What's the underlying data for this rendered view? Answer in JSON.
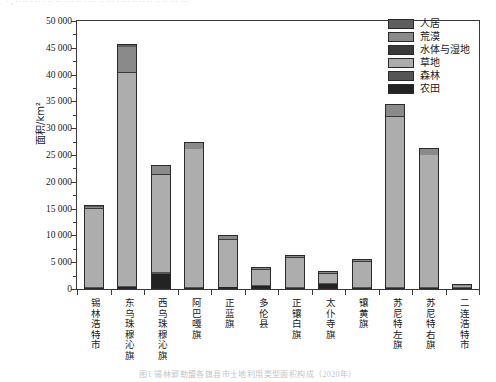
{
  "edges": {
    "top_fragment": "· , ·· ·· ·  ·· · ·· ·· ···· ·· · ··· ·· ··· · ··· ·· ·· ·· ·· ·· ··· ···",
    "bottom_fragment": "图1  锡林郭勒盟各旗县市土地利用类型面积构成（2020年）"
  },
  "chart_data": {
    "type": "bar",
    "stacked": true,
    "title": "",
    "xlabel": "",
    "ylabel": "面积/km²",
    "ylim": [
      0,
      50000
    ],
    "ytick_step": 5000,
    "yminor_step": 1250,
    "grid": false,
    "legend_position": "top-right",
    "ytick_labels": [
      "0",
      "5 000",
      "10 000",
      "15 000",
      "20 000",
      "25 000",
      "30 000",
      "35 000",
      "40 000",
      "45 000",
      "50 000"
    ],
    "ytick_values": [
      0,
      5000,
      10000,
      15000,
      20000,
      25000,
      30000,
      35000,
      40000,
      45000,
      50000
    ],
    "categories": [
      "锡林浩特市",
      "东乌珠穆沁旗",
      "西乌珠穆沁旗",
      "阿巴嘎旗",
      "正蓝旗",
      "多伦县",
      "正镶白旗",
      "太仆寺旗",
      "镶黄旗",
      "苏尼特左旗",
      "苏尼特右旗",
      "二连浩特市"
    ],
    "series": [
      {
        "name": "农田",
        "color": "#232323",
        "values": [
          60,
          420,
          2750,
          60,
          300,
          560,
          160,
          980,
          90,
          60,
          80,
          10
        ]
      },
      {
        "name": "森林",
        "color": "#555555",
        "values": [
          40,
          130,
          340,
          40,
          120,
          150,
          60,
          110,
          40,
          40,
          50,
          5
        ]
      },
      {
        "name": "草地",
        "color": "#adadad",
        "values": [
          14600,
          39700,
          18100,
          25700,
          8700,
          2900,
          5400,
          1750,
          4700,
          31800,
          24600,
          120
        ]
      },
      {
        "name": "水体与湿地",
        "color": "#3a3a3a",
        "values": [
          120,
          230,
          200,
          110,
          140,
          90,
          80,
          60,
          70,
          140,
          110,
          5
        ]
      },
      {
        "name": "荒漠",
        "color": "#8a8a8a",
        "values": [
          140,
          4620,
          1480,
          1080,
          640,
          160,
          200,
          90,
          150,
          2050,
          1000,
          60
        ]
      },
      {
        "name": "人居",
        "color": "#5e5e5e",
        "values": [
          420,
          620,
          350,
          180,
          230,
          180,
          160,
          190,
          140,
          250,
          230,
          60
        ]
      }
    ],
    "totals": [
      15380,
      45720,
      23220,
      27170,
      10130,
      4040,
      6060,
      3180,
      5190,
      34340,
      26070,
      260
    ]
  },
  "legend": {
    "items": [
      {
        "label": "人居",
        "color": "#5e5e5e"
      },
      {
        "label": "荒漠",
        "color": "#8a8a8a"
      },
      {
        "label": "水体与湿地",
        "color": "#3a3a3a"
      },
      {
        "label": "草地",
        "color": "#adadad"
      },
      {
        "label": "森林",
        "color": "#555555"
      },
      {
        "label": "农田",
        "color": "#232323"
      }
    ]
  }
}
